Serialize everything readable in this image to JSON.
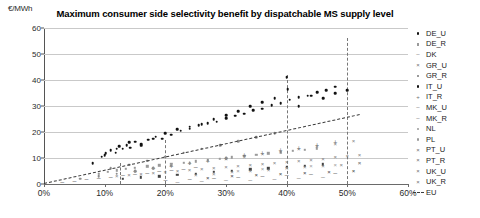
{
  "chart_data": {
    "type": "scatter",
    "title": "Maximum consumer side selectivity benefit  by dispatchable MS supply level",
    "ylabel": "€/MWh",
    "xlabel": "",
    "ylim": [
      0,
      60
    ],
    "xlim": [
      0,
      60
    ],
    "ytick_labels": [
      "0",
      "10",
      "20",
      "30",
      "40",
      "50",
      "60"
    ],
    "ytick_values": [
      0,
      10,
      20,
      30,
      40,
      50,
      60
    ],
    "xtick_labels": [
      "0%",
      "10%",
      "20%",
      "30%",
      "40%",
      "50%",
      "60%"
    ],
    "xtick_values": [
      0,
      10,
      20,
      30,
      40,
      50,
      60
    ],
    "grid": "horizontal",
    "legend_position": "right",
    "reference_lines": [
      {
        "x": 12.5,
        "label": "",
        "style": "dashed",
        "y_top": 8
      },
      {
        "x": 20.0,
        "label": "",
        "style": "dashed",
        "y_top": 17
      },
      {
        "x": 40.0,
        "label": "",
        "style": "dashed",
        "y_top": 42
      },
      {
        "x": 50.0,
        "label": "",
        "style": "dashed",
        "y_top": 56
      }
    ],
    "trend": {
      "name": "EU",
      "style": "dashed",
      "x0": 0,
      "y0": 0.5,
      "x1": 52,
      "y1": 27
    },
    "series": [
      {
        "name": "DE_U",
        "marker": "dot",
        "color": "#111111",
        "points": [
          [
            9.5,
            10.5
          ],
          [
            10.2,
            11.8
          ],
          [
            11.0,
            13.0
          ],
          [
            11.8,
            12.0
          ],
          [
            12.4,
            14.5
          ],
          [
            13.0,
            13.6
          ],
          [
            13.6,
            15.0
          ],
          [
            14.2,
            14.0
          ],
          [
            15.0,
            16.2
          ],
          [
            16.0,
            15.4
          ],
          [
            17.2,
            17.0
          ],
          [
            18.4,
            18.2
          ],
          [
            19.5,
            17.4
          ],
          [
            21.0,
            19.0
          ],
          [
            22.5,
            20.5
          ],
          [
            24.0,
            21.2
          ],
          [
            25.5,
            22.6
          ],
          [
            27.0,
            23.4
          ],
          [
            28.5,
            24.0
          ],
          [
            30.0,
            25.4
          ],
          [
            31.5,
            26.2
          ],
          [
            33.0,
            27.0
          ],
          [
            34.5,
            28.4
          ],
          [
            36.0,
            29.0
          ],
          [
            37.5,
            30.2
          ],
          [
            39.0,
            31.0
          ],
          [
            40.5,
            32.5
          ],
          [
            42.0,
            33.4
          ],
          [
            43.5,
            34.0
          ],
          [
            45.0,
            35.2
          ],
          [
            46.5,
            36.0
          ],
          [
            48.0,
            37.4
          ]
        ]
      },
      {
        "name": "DE_R",
        "marker": "square",
        "color": "#9a9a9a",
        "points": [
          [
            9.0,
            4.0
          ],
          [
            10.5,
            4.6
          ],
          [
            12.0,
            5.2
          ],
          [
            13.5,
            5.8
          ],
          [
            15.0,
            6.2
          ],
          [
            17.0,
            6.8
          ],
          [
            19.0,
            7.2
          ],
          [
            21.0,
            7.8
          ],
          [
            23.0,
            8.2
          ],
          [
            25.0,
            8.8
          ],
          [
            27.0,
            9.2
          ],
          [
            29.0,
            9.8
          ],
          [
            31.0,
            10.2
          ],
          [
            33.0,
            10.8
          ],
          [
            35.0,
            11.2
          ],
          [
            37.0,
            11.8
          ],
          [
            39.0,
            12.2
          ],
          [
            41.0,
            12.8
          ],
          [
            43.0,
            13.2
          ],
          [
            45.0,
            13.8
          ]
        ]
      },
      {
        "name": "DK",
        "marker": "dash",
        "color": "#6f6f6f",
        "points": [
          [
            3.0,
            1.0
          ],
          [
            5.0,
            1.6
          ],
          [
            7.0,
            2.2
          ],
          [
            9.0,
            2.8
          ],
          [
            11.0,
            3.2
          ],
          [
            13.0,
            3.8
          ],
          [
            15.0,
            4.2
          ],
          [
            17.0,
            4.8
          ],
          [
            19.0,
            5.2
          ],
          [
            21.0,
            5.8
          ],
          [
            23.0,
            6.2
          ],
          [
            25.0,
            6.8
          ]
        ]
      },
      {
        "name": "GR_U",
        "marker": "ex",
        "color": "#7e7e7e",
        "points": [
          [
            12.0,
            3.0
          ],
          [
            14.0,
            3.4
          ],
          [
            16.0,
            3.8
          ],
          [
            18.0,
            4.2
          ],
          [
            20.0,
            4.6
          ],
          [
            22.0,
            5.0
          ],
          [
            24.0,
            5.4
          ],
          [
            26.0,
            5.8
          ],
          [
            28.0,
            6.2
          ],
          [
            30.0,
            6.6
          ],
          [
            32.0,
            7.0
          ],
          [
            34.0,
            7.4
          ],
          [
            36.0,
            7.8
          ],
          [
            38.0,
            8.2
          ],
          [
            40.0,
            8.6
          ],
          [
            42.0,
            9.0
          ],
          [
            44.0,
            9.4
          ],
          [
            46.0,
            9.8
          ],
          [
            48.0,
            10.2
          ],
          [
            50.0,
            10.6
          ],
          [
            52.0,
            11.0
          ]
        ]
      },
      {
        "name": "GR_R",
        "marker": "square-dark",
        "color": "#444444",
        "points": [
          [
            13.0,
            2.0
          ],
          [
            16.0,
            2.6
          ],
          [
            19.0,
            3.0
          ],
          [
            22.0,
            3.6
          ],
          [
            25.0,
            4.0
          ],
          [
            28.0,
            4.6
          ],
          [
            31.0,
            5.0
          ],
          [
            34.0,
            5.6
          ],
          [
            37.0,
            6.0
          ],
          [
            40.0,
            6.6
          ],
          [
            43.0,
            7.0
          ],
          [
            46.0,
            7.6
          ]
        ]
      },
      {
        "name": "IT_U",
        "marker": "dot",
        "color": "#111111",
        "points": [
          [
            8.0,
            8.0
          ],
          [
            10.0,
            11.0
          ],
          [
            12.0,
            13.5
          ],
          [
            14.0,
            16.0
          ],
          [
            16.0,
            14.8
          ],
          [
            18.0,
            17.5
          ],
          [
            20.0,
            19.5
          ],
          [
            22.0,
            21.0
          ],
          [
            24.0,
            22.0
          ],
          [
            26.0,
            23.0
          ],
          [
            28.0,
            25.0
          ],
          [
            30.0,
            26.5
          ],
          [
            32.0,
            28.0
          ],
          [
            34.0,
            30.0
          ],
          [
            36.0,
            31.5
          ],
          [
            38.0,
            33.0
          ],
          [
            40.0,
            41.0
          ],
          [
            40.2,
            36.5
          ],
          [
            42.0,
            30.0
          ],
          [
            44.0,
            34.0
          ],
          [
            46.0,
            33.0
          ],
          [
            48.0,
            35.0
          ],
          [
            50.0,
            36.0
          ]
        ]
      },
      {
        "name": "IT_R",
        "marker": "plus",
        "color": "#6f6f6f",
        "points": [
          [
            15.0,
            5.0
          ],
          [
            18.0,
            6.0
          ],
          [
            21.0,
            7.0
          ],
          [
            24.0,
            8.0
          ],
          [
            27.0,
            9.0
          ],
          [
            30.0,
            10.0
          ],
          [
            33.0,
            11.0
          ],
          [
            36.0,
            12.0
          ],
          [
            39.0,
            13.0
          ],
          [
            42.0,
            14.0
          ],
          [
            45.0,
            15.0
          ],
          [
            48.0,
            16.0
          ]
        ]
      },
      {
        "name": "MK_U",
        "marker": "dash",
        "color": "#6f6f6f",
        "points": [
          [
            20.0,
            2.0
          ],
          [
            24.0,
            2.4
          ],
          [
            28.0,
            2.8
          ],
          [
            32.0,
            3.2
          ],
          [
            36.0,
            3.6
          ],
          [
            40.0,
            4.0
          ],
          [
            44.0,
            4.4
          ],
          [
            48.0,
            4.8
          ]
        ]
      },
      {
        "name": "MK_R",
        "marker": "dash",
        "color": "#8d8d8d",
        "points": [
          [
            22.0,
            1.2
          ],
          [
            26.0,
            1.5
          ],
          [
            30.0,
            1.8
          ],
          [
            34.0,
            2.1
          ],
          [
            38.0,
            2.4
          ],
          [
            42.0,
            2.7
          ],
          [
            46.0,
            3.0
          ]
        ]
      },
      {
        "name": "NL",
        "marker": "dot-grey",
        "color": "#8d8d8d",
        "points": [
          [
            6.0,
            2.0
          ],
          [
            9.0,
            3.0
          ],
          [
            12.0,
            4.0
          ],
          [
            15.0,
            5.0
          ],
          [
            18.0,
            6.0
          ],
          [
            21.0,
            7.0
          ],
          [
            24.0,
            8.0
          ],
          [
            27.0,
            9.0
          ],
          [
            30.0,
            10.0
          ]
        ]
      },
      {
        "name": "PL",
        "marker": "dot-grey",
        "color": "#8d8d8d",
        "points": [
          [
            11.0,
            6.0
          ],
          [
            14.0,
            7.5
          ],
          [
            17.0,
            9.0
          ],
          [
            20.0,
            10.5
          ],
          [
            23.0,
            12.0
          ],
          [
            26.0,
            13.5
          ],
          [
            29.0,
            15.0
          ],
          [
            32.0,
            16.5
          ],
          [
            35.0,
            18.0
          ],
          [
            38.0,
            19.5
          ]
        ]
      },
      {
        "name": "PT_U",
        "marker": "ex",
        "color": "#7e7e7e",
        "points": [
          [
            25.0,
            3.5
          ],
          [
            28.0,
            4.0
          ],
          [
            31.0,
            4.5
          ],
          [
            34.0,
            5.0
          ],
          [
            37.0,
            5.5
          ],
          [
            40.0,
            6.0
          ],
          [
            43.0,
            6.5
          ],
          [
            46.0,
            7.0
          ],
          [
            49.0,
            7.5
          ],
          [
            52.0,
            8.0
          ]
        ]
      },
      {
        "name": "PT_R",
        "marker": "ex-dark",
        "color": "#3c3c3c",
        "points": [
          [
            27.0,
            2.5
          ],
          [
            31.0,
            2.9
          ],
          [
            35.0,
            3.3
          ],
          [
            39.0,
            3.7
          ],
          [
            43.0,
            4.1
          ],
          [
            47.0,
            4.5
          ],
          [
            51.0,
            4.9
          ]
        ]
      },
      {
        "name": "UK_U",
        "marker": "ex",
        "color": "#7e7e7e",
        "points": [
          [
            30.0,
            9.5
          ],
          [
            33.0,
            10.5
          ],
          [
            36.0,
            11.5
          ],
          [
            39.0,
            12.5
          ],
          [
            42.0,
            13.5
          ],
          [
            45.0,
            14.5
          ],
          [
            48.0,
            15.5
          ],
          [
            51.0,
            16.5
          ]
        ]
      },
      {
        "name": "UK_R",
        "marker": "ex",
        "color": "#9a9a9a",
        "points": [
          [
            32.0,
            5.0
          ],
          [
            36.0,
            5.6
          ],
          [
            40.0,
            6.2
          ],
          [
            44.0,
            6.8
          ],
          [
            48.0,
            7.4
          ],
          [
            52.0,
            8.0
          ]
        ]
      },
      {
        "name": "EU",
        "marker": "dashed-line",
        "color": "#3b3b3b",
        "points": []
      }
    ]
  },
  "legend": {
    "entries": [
      {
        "label": "DE_U",
        "marker": "dot"
      },
      {
        "label": "DE_R",
        "marker": "square"
      },
      {
        "label": "DK",
        "marker": "dash"
      },
      {
        "label": "GR_U",
        "marker": "ex"
      },
      {
        "label": "GR_R",
        "marker": "square-dark"
      },
      {
        "label": "IT_U",
        "marker": "dot"
      },
      {
        "label": "IT_R",
        "marker": "plus"
      },
      {
        "label": "MK_U",
        "marker": "dash"
      },
      {
        "label": "MK_R",
        "marker": "dash"
      },
      {
        "label": "NL",
        "marker": "dot-grey"
      },
      {
        "label": "PL",
        "marker": "dot-grey"
      },
      {
        "label": "PT_U",
        "marker": "ex"
      },
      {
        "label": "PT_R",
        "marker": "ex-dark"
      },
      {
        "label": "UK_U",
        "marker": "ex"
      },
      {
        "label": "UK_R",
        "marker": "ex"
      },
      {
        "label": "EU",
        "marker": "dashed-line"
      }
    ]
  }
}
